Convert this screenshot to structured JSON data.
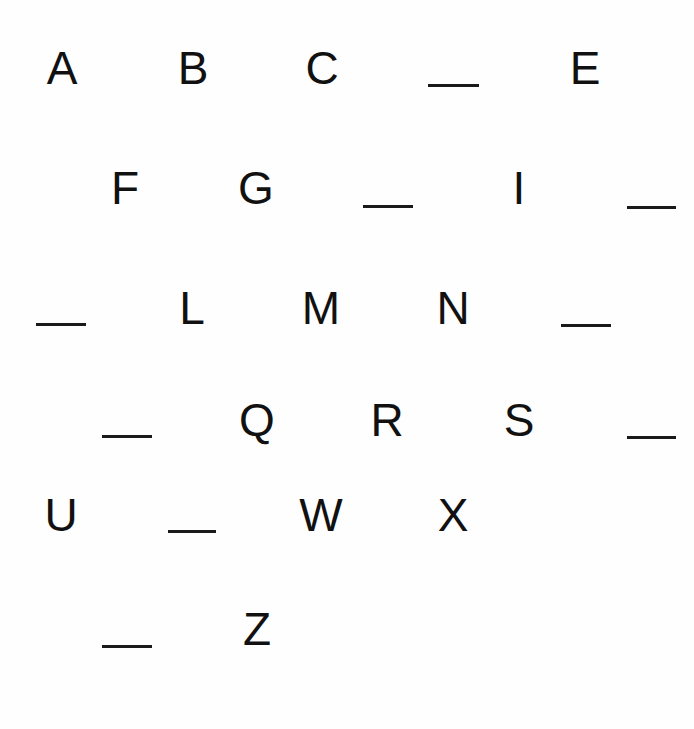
{
  "worksheet": {
    "task": "missing-letters",
    "items": [
      {
        "type": "letter",
        "value": "A",
        "x": 62,
        "y": 45
      },
      {
        "type": "letter",
        "value": "B",
        "x": 193,
        "y": 45
      },
      {
        "type": "letter",
        "value": "C",
        "x": 322,
        "y": 45
      },
      {
        "type": "blank",
        "value": "",
        "x": 428,
        "y": 84,
        "w": 51
      },
      {
        "type": "letter",
        "value": "E",
        "x": 585,
        "y": 45
      },
      {
        "type": "letter",
        "value": "F",
        "x": 125,
        "y": 165
      },
      {
        "type": "letter",
        "value": "G",
        "x": 256,
        "y": 165
      },
      {
        "type": "blank",
        "value": "",
        "x": 363,
        "y": 205,
        "w": 50
      },
      {
        "type": "letter",
        "value": "I",
        "x": 519,
        "y": 165
      },
      {
        "type": "blank",
        "value": "",
        "x": 627,
        "y": 206,
        "w": 49
      },
      {
        "type": "blank",
        "value": "",
        "x": 36,
        "y": 323,
        "w": 50
      },
      {
        "type": "letter",
        "value": "L",
        "x": 192,
        "y": 285
      },
      {
        "type": "letter",
        "value": "M",
        "x": 321,
        "y": 285
      },
      {
        "type": "letter",
        "value": "N",
        "x": 453,
        "y": 285
      },
      {
        "type": "blank",
        "value": "",
        "x": 561,
        "y": 324,
        "w": 50
      },
      {
        "type": "blank",
        "value": "",
        "x": 102,
        "y": 435,
        "w": 50
      },
      {
        "type": "letter",
        "value": "Q",
        "x": 257,
        "y": 397
      },
      {
        "type": "letter",
        "value": "R",
        "x": 387,
        "y": 397
      },
      {
        "type": "letter",
        "value": "S",
        "x": 519,
        "y": 397
      },
      {
        "type": "blank",
        "value": "",
        "x": 627,
        "y": 436,
        "w": 49
      },
      {
        "type": "letter",
        "value": "U",
        "x": 61,
        "y": 492
      },
      {
        "type": "blank",
        "value": "",
        "x": 168,
        "y": 530,
        "w": 48
      },
      {
        "type": "letter",
        "value": "W",
        "x": 321,
        "y": 492
      },
      {
        "type": "letter",
        "value": "X",
        "x": 453,
        "y": 492
      },
      {
        "type": "blank",
        "value": "",
        "x": 102,
        "y": 645,
        "w": 50
      },
      {
        "type": "letter",
        "value": "Z",
        "x": 257,
        "y": 606
      }
    ]
  }
}
